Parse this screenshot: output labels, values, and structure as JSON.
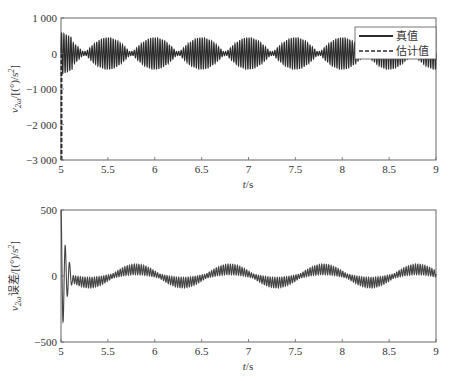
{
  "chart_data": [
    {
      "type": "line",
      "title": "",
      "xlabel": "t/s",
      "ylabel": "v_2ω/[(°)/s²]",
      "xlim": [
        5,
        9
      ],
      "ylim": [
        -3000,
        1000
      ],
      "xticks": [
        5,
        5.5,
        6,
        6.5,
        7,
        7.5,
        8,
        8.5,
        9
      ],
      "xtick_labels": [
        "5",
        "5.5",
        "6",
        "6.5",
        "7",
        "7.5",
        "8",
        "8.5",
        "9"
      ],
      "yticks": [
        -3000,
        -2000,
        -1000,
        0,
        1000
      ],
      "ytick_labels": [
        "−3 000",
        "−2 000",
        "−1 000",
        "0",
        "1 000"
      ],
      "grid": false,
      "legend_position": "upper right",
      "series": [
        {
          "name": "真值",
          "style": "solid",
          "description": "High-frequency oscillation (~40 Hz) with beat envelope; amplitude peaks ~450 at t≈5.5, 6.0, 6.5, 7.0 ... (period ~0.5 s), near 0 at t≈5.27, 5.77, 6.27 ...",
          "carrier_hz": 40,
          "envelope_peak": 450,
          "envelope_period_s": 0.5,
          "initial_peak": 600
        },
        {
          "name": "估计值",
          "style": "dashed",
          "description": "Estimate starts at about −3000 at t=5 and converges rapidly to the true value within ~0.02 s, then overlaps the true curve",
          "initial_value": -3000
        }
      ]
    },
    {
      "type": "line",
      "title": "",
      "xlabel": "t/s",
      "ylabel": "v_2ω误差/[(°)/s²]",
      "xlim": [
        5,
        9
      ],
      "ylim": [
        -500,
        500
      ],
      "xticks": [
        5,
        5.5,
        6,
        6.5,
        7,
        7.5,
        8,
        8.5,
        9
      ],
      "xtick_labels": [
        "5",
        "5.5",
        "6",
        "6.5",
        "7",
        "7.5",
        "8",
        "8.5",
        "9"
      ],
      "yticks": [
        -500,
        0,
        500
      ],
      "ytick_labels": [
        "−500",
        "0",
        "500"
      ],
      "grid": false,
      "series": [
        {
          "name": "误差",
          "style": "solid",
          "description": "Large transient at t≈5.0–5.1 (spikes to +500, −450, +270), then ~40 Hz oscillation of amplitude ~40 riding on a slow ~1 Hz wave of amplitude ~50 (positive humps near t≈5.8, 6.8, 7.8, 8.8; negative near 6.3, 7.3, 8.3)",
          "transient_peaks": [
            500,
            -450,
            270,
            -120
          ],
          "carrier_hz": 40,
          "carrier_amplitude": 40,
          "slow_wave_hz": 1,
          "slow_wave_amplitude": 50
        }
      ]
    }
  ],
  "top": {
    "ylabel_main": "v",
    "ylabel_sub": "2ω",
    "ylabel_rest": "/[(°)/s",
    "ylabel_sup": "2",
    "ylabel_end": "]",
    "xlabel_t": "t",
    "xlabel_rest": "/s",
    "legend": {
      "true_label": "真值",
      "est_label": "估计值"
    }
  },
  "bottom": {
    "ylabel_main": "v",
    "ylabel_sub": "2ω",
    "ylabel_rest": "误差/[(°)/s",
    "ylabel_sup": "2",
    "ylabel_end": "]",
    "xlabel_t": "t",
    "xlabel_rest": "/s"
  },
  "colors": {
    "line": "#2b2b2b",
    "axis": "#555555",
    "text": "#333333"
  }
}
